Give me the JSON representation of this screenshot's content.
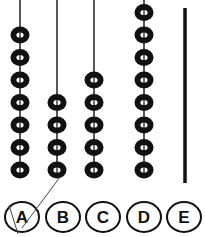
{
  "figure": {
    "colors": {
      "ink": "#111111",
      "background": "#ffffff"
    }
  },
  "rods": [
    {
      "id": "A",
      "beads": 7
    },
    {
      "id": "B",
      "beads": 4
    },
    {
      "id": "C",
      "beads": 5
    },
    {
      "id": "D",
      "beads": 8
    },
    {
      "id": "E",
      "beads": 0
    }
  ],
  "options": [
    {
      "label": "A",
      "selected": true
    },
    {
      "label": "B",
      "selected": false
    },
    {
      "label": "C",
      "selected": false
    },
    {
      "label": "D",
      "selected": false
    },
    {
      "label": "E",
      "selected": false
    }
  ]
}
